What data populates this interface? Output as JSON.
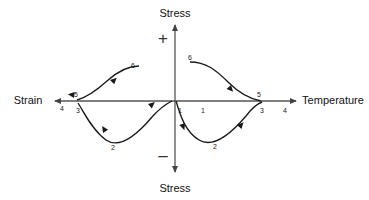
{
  "figure": {
    "type": "diagram",
    "background_color": "#ffffff",
    "curve_color": "#1a1a1a",
    "axis_color": "#555555"
  },
  "axes": {
    "vertical": {
      "top_label": "Stress",
      "bottom_label": "Stress",
      "positive_sign": "+",
      "negative_sign": "–",
      "x": 175,
      "top_y": 22,
      "bottom_y": 175
    },
    "horizontal": {
      "left_label": "Strain",
      "right_label": "Temperature",
      "y": 101,
      "left_x": 52,
      "right_x": 298
    }
  },
  "step_labels": {
    "left_branch": [
      {
        "text": "4",
        "x": 62,
        "y": 108
      },
      {
        "text": "5",
        "x": 76,
        "y": 94
      },
      {
        "text": "3",
        "x": 78,
        "y": 110
      },
      {
        "text": "2",
        "x": 113,
        "y": 147
      },
      {
        "text": "6",
        "x": 133,
        "y": 65
      }
    ],
    "right_branch": [
      {
        "text": "1",
        "x": 180,
        "y": 110
      },
      {
        "text": "1",
        "x": 203,
        "y": 110
      },
      {
        "text": "2",
        "x": 215,
        "y": 146
      },
      {
        "text": "3",
        "x": 262,
        "y": 110
      },
      {
        "text": "5",
        "x": 259,
        "y": 94
      },
      {
        "text": "4",
        "x": 285,
        "y": 110
      },
      {
        "text": "6",
        "x": 190,
        "y": 57
      }
    ]
  }
}
